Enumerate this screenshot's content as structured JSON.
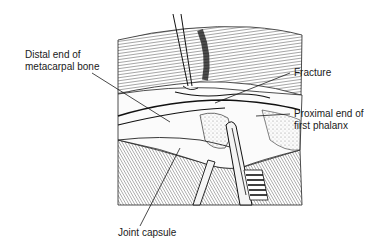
{
  "figure": {
    "labels": {
      "distal_metacarpal": [
        "Distal end of",
        "metacarpal bone"
      ],
      "fracture": "Fracture",
      "proximal_phalanx": [
        "Proximal end of",
        "first phalanx"
      ],
      "joint_capsule": "Joint capsule"
    },
    "colors": {
      "ink": "#1a1a1a",
      "hatch": "#555555",
      "shade": "#8a8a8a",
      "background": "#ffffff"
    }
  }
}
